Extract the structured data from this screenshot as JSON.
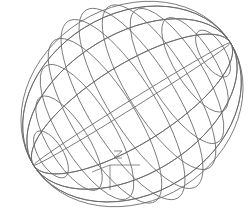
{
  "viewport": {
    "background": "#ffffff",
    "wire_color": "#6a6a6a",
    "object": "ellipsoid-wireframe",
    "latitude_rings": 10,
    "meridian_curves": 8
  },
  "ucs_icon": {
    "axis_label": "Z",
    "color": "#707070"
  }
}
